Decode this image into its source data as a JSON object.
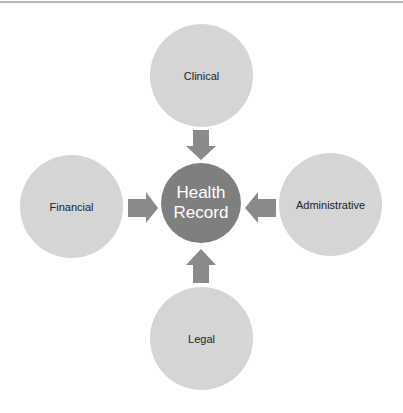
{
  "diagram": {
    "center": {
      "label_line1": "Health",
      "label_line2": "Record"
    },
    "nodes": {
      "top": {
        "label": "Clinical"
      },
      "left": {
        "label": "Financial"
      },
      "right": {
        "label": "Administrative"
      },
      "bottom": {
        "label": "Legal"
      }
    },
    "arrows": [
      {
        "from": "Clinical",
        "to": "Health Record",
        "direction": "down"
      },
      {
        "from": "Financial",
        "to": "Health Record",
        "direction": "right"
      },
      {
        "from": "Administrative",
        "to": "Health Record",
        "direction": "left"
      },
      {
        "from": "Legal",
        "to": "Health Record",
        "direction": "up"
      }
    ],
    "colors": {
      "outer_circle": "#d5d5d5",
      "center_circle": "#7f7f7f",
      "arrow": "#8a8a8a",
      "center_text": "#ffffff",
      "outer_text": "#222222"
    }
  }
}
